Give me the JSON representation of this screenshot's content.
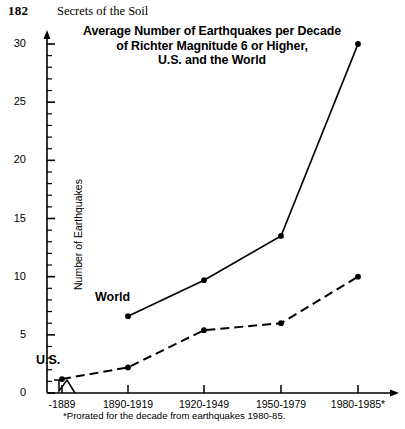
{
  "running_head": {
    "page_number": "182",
    "book_title": "Secrets of the Soil"
  },
  "chart_data": {
    "type": "line",
    "title": "Average Number of Earthquakes per Decade of Richter Magnitude 6 or Higher, U.S. and the World",
    "title_lines": [
      "Average Number of Earthquakes per Decade",
      "of Richter Magnitude 6 or Higher,",
      "U.S. and the World"
    ],
    "xlabel": "",
    "ylabel": "Number of Earthquakes",
    "categories": [
      "-1889",
      "1890-1919",
      "1920-1949",
      "1950-1979",
      "1980-1985*"
    ],
    "ylim": [
      0,
      30
    ],
    "yticks": [
      0,
      5,
      10,
      15,
      20,
      25,
      30
    ],
    "ytick_labels": [
      "0",
      "5",
      "10",
      "15",
      "20",
      "25",
      "30"
    ],
    "y_minor_tick_step": 1,
    "grid": false,
    "legend": "inline-labels",
    "axis_break": true,
    "series": [
      {
        "name": "World",
        "style": "solid",
        "label": "World",
        "values": [
          null,
          6.6,
          9.7,
          13.5,
          30.0
        ]
      },
      {
        "name": "U.S.",
        "style": "dashed",
        "label": "U.S.",
        "values": [
          1.2,
          2.2,
          5.4,
          6.0,
          10.0
        ]
      }
    ],
    "footnote": "*Prorated for the decade from earthquakes 1980-85."
  },
  "colors": {
    "ink": "#000000",
    "background": "#ffffff"
  }
}
